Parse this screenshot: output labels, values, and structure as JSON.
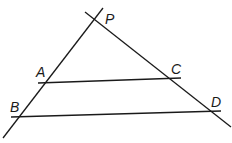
{
  "diagram": {
    "type": "geometry",
    "points": [
      {
        "id": "P",
        "label": "P",
        "x": 95,
        "y": 19,
        "label_x": 105,
        "label_y": 24
      },
      {
        "id": "A",
        "label": "A",
        "x": 47,
        "y": 82,
        "label_x": 36,
        "label_y": 77
      },
      {
        "id": "C",
        "label": "C",
        "x": 170,
        "y": 79,
        "label_x": 171,
        "label_y": 74
      },
      {
        "id": "B",
        "label": "B",
        "x": 21,
        "y": 116,
        "label_x": 10,
        "label_y": 112
      },
      {
        "id": "D",
        "label": "D",
        "x": 211,
        "y": 111,
        "label_x": 211,
        "label_y": 107
      }
    ],
    "lines": [
      {
        "id": "line-PB",
        "x1": 3,
        "y1": 138,
        "x2": 103,
        "y2": 8
      },
      {
        "id": "line-PD",
        "x1": 85,
        "y1": 12,
        "x2": 231,
        "y2": 127
      },
      {
        "id": "line-AC",
        "x1": 38,
        "y1": 83,
        "x2": 181,
        "y2": 78
      },
      {
        "id": "line-BD",
        "x1": 11,
        "y1": 117,
        "x2": 221,
        "y2": 111
      }
    ],
    "colors": {
      "stroke": "#1a1a1a",
      "background": "#ffffff"
    }
  }
}
